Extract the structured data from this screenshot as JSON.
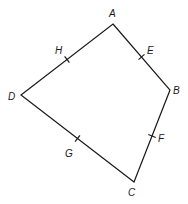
{
  "figure": {
    "type": "quadrilateral",
    "vertices": {
      "A": {
        "label": "A",
        "x": 113,
        "y": 24
      },
      "B": {
        "label": "B",
        "x": 170,
        "y": 90
      },
      "C": {
        "label": "C",
        "x": 134,
        "y": 182
      },
      "D": {
        "label": "D",
        "x": 21,
        "y": 95
      }
    },
    "midpoints": {
      "E": {
        "label": "E",
        "on_segment": "AB"
      },
      "F": {
        "label": "F",
        "on_segment": "BC"
      },
      "G": {
        "label": "G",
        "on_segment": "CD"
      },
      "H": {
        "label": "H",
        "on_segment": "DA"
      }
    },
    "stroke_color": "#1a1a1a",
    "background_color": "#ffffff"
  }
}
